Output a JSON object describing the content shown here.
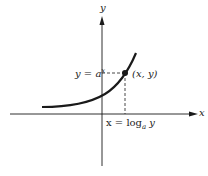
{
  "diagram": {
    "axes": {
      "x_label": "x",
      "y_label": "y"
    },
    "curve_label_y": "y = a",
    "curve_label_y_exp": "x",
    "point_label": "(x, y)",
    "x_label_prefix": "x = log",
    "x_label_sub": "a",
    "x_label_suffix": " y",
    "colors": {
      "stroke": "#1a1a1a",
      "background": "#ffffff"
    }
  }
}
